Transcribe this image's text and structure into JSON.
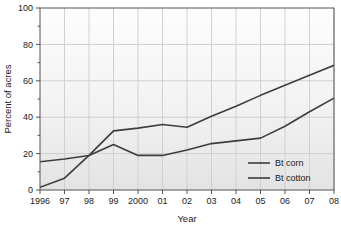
{
  "chart_data": {
    "type": "line",
    "title": "",
    "xlabel": "Year",
    "ylabel": "Percent of acres",
    "x": [
      1996,
      1997,
      1998,
      1999,
      2000,
      2001,
      2002,
      2003,
      2004,
      2005,
      2006,
      2007,
      2008
    ],
    "xtick_labels": [
      "1996",
      "97",
      "98",
      "99",
      "2000",
      "01",
      "02",
      "03",
      "04",
      "05",
      "06",
      "07",
      "08"
    ],
    "ytick_labels": [
      "0",
      "20",
      "40",
      "60",
      "80",
      "100"
    ],
    "yticks": [
      0,
      20,
      40,
      60,
      80,
      100
    ],
    "ylim": [
      0,
      100
    ],
    "xlim": [
      1996,
      2008
    ],
    "minor_yticks": [
      10,
      30,
      50,
      70,
      90
    ],
    "grid": true,
    "legend_position": "bottom-right",
    "series": [
      {
        "name": "Bt corn",
        "color": "#3d3d3d",
        "values": [
          15.5,
          17.0,
          19.0,
          25.0,
          19.0,
          19.0,
          22.0,
          25.5,
          27.0,
          28.5,
          35.0,
          43.0,
          50.5
        ]
      },
      {
        "name": "Bt cotton",
        "color": "#3d3d3d",
        "values": [
          1.5,
          6.5,
          19.0,
          32.5,
          34.0,
          36.0,
          34.5,
          40.5,
          46.0,
          52.0,
          57.5,
          63.0,
          68.5
        ]
      }
    ]
  },
  "legend": {
    "entries": [
      {
        "label": "Bt corn"
      },
      {
        "label": "Bt cotton"
      }
    ]
  },
  "axes": {
    "x_title": "Year",
    "y_title": "Percent of acres"
  },
  "colors": {
    "line": "#3d3d3d",
    "grid": "#d0d0d0",
    "frame": "#555555",
    "plot_bg_top": "#fdfdfd",
    "plot_bg_bottom": "#e2e2e2",
    "text": "#1a1a1a"
  }
}
